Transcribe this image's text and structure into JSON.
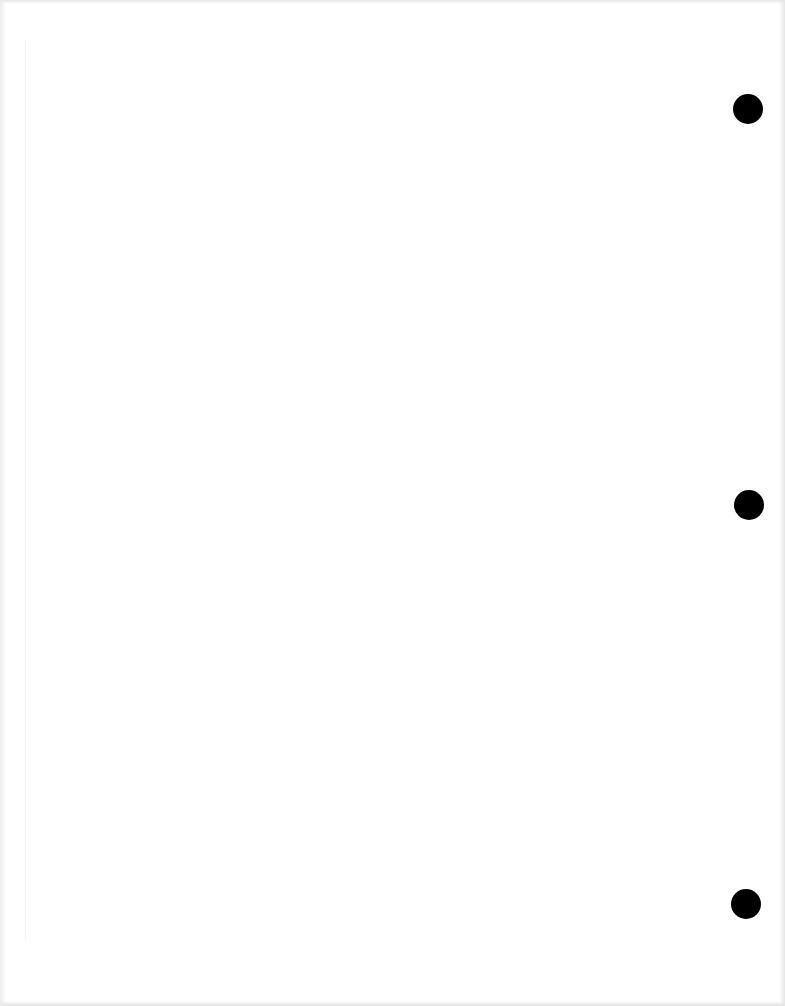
{
  "page": {
    "type": "blank scanned page",
    "background_color": "#ffffff",
    "punch_holes": [
      {
        "cx": 748,
        "cy": 109,
        "diameter": 30
      },
      {
        "cx": 749,
        "cy": 505,
        "diameter": 30
      },
      {
        "cx": 746,
        "cy": 904,
        "diameter": 30
      }
    ],
    "hole_color": "#000000"
  }
}
